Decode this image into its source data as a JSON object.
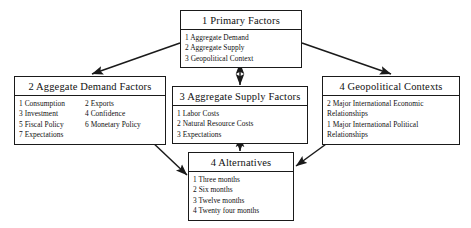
{
  "diagram": {
    "background_color": "#ffffff",
    "line_color": "#1a1a1a",
    "text_color": "#111111"
  },
  "nodes": {
    "primary": {
      "title": "1 Primary Factors",
      "items": [
        "1 Aggregate Demand",
        "2 Aggregate Supply",
        "3 Geopolitical Context"
      ]
    },
    "demand": {
      "title": "2 Aggegate Demand Factors",
      "items_left": [
        "1 Consumption",
        "3 Investment",
        "5 Fiscal Policy",
        "7 Expectations"
      ],
      "items_right": [
        "2 Exports",
        "4 Confidence",
        "6 Monetary Policy"
      ]
    },
    "supply": {
      "title": "3 Aggregate Supply Factors",
      "items": [
        "1 Labor Costs",
        "2 Natural Resource Costs",
        "3 Expectations"
      ]
    },
    "geopolitical": {
      "title": "4 Geopolitical Contexts",
      "items": [
        "2 Major International Economic Relationships",
        "1 Major International Political Relationships"
      ]
    },
    "alternatives": {
      "title": "4 Alternatives",
      "items": [
        "1 Three months",
        "2 Six months",
        "3 Twelve months",
        "4 Twenty four months"
      ]
    }
  },
  "connectors": [
    {
      "name": "primary-to-demand",
      "from": "primary",
      "to": "demand",
      "style": "single-arrow"
    },
    {
      "name": "primary-to-supply",
      "from": "primary",
      "to": "supply",
      "style": "double-arrow"
    },
    {
      "name": "primary-to-geopolitical",
      "from": "primary",
      "to": "geopolitical",
      "style": "single-arrow"
    },
    {
      "name": "demand-to-alternatives",
      "from": "demand",
      "to": "alternatives",
      "style": "single-arrow"
    },
    {
      "name": "supply-to-alternatives",
      "from": "supply",
      "to": "alternatives",
      "style": "double-arrow"
    },
    {
      "name": "geopolitical-to-alternatives",
      "from": "geopolitical",
      "to": "alternatives",
      "style": "single-arrow"
    }
  ]
}
